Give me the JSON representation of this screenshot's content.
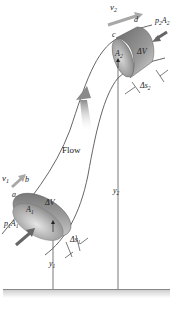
{
  "figure": {
    "flow_label": "Flow",
    "labels": {
      "v1": "v",
      "v1_sub": "1",
      "v2": "v",
      "v2_sub": "2",
      "a": "a",
      "b": "b",
      "c": "c",
      "d": "d",
      "A1": "A",
      "A1_sub": "1",
      "A2": "A",
      "A2_sub": "2",
      "dV1": "ΔV",
      "dV2": "ΔV",
      "p1A1": "p",
      "p1A1_sub1": "1",
      "p1A1_A": "A",
      "p1A1_sub2": "1",
      "p2A2": "p",
      "p2A2_sub1": "2",
      "p2A2_A": "A",
      "p2A2_sub2": "2",
      "ds1": "Δs",
      "ds1_sub": "1",
      "ds2": "Δs",
      "ds2_sub": "2",
      "y1": "y",
      "y1_sub": "1",
      "y2": "y",
      "y2_sub": "2"
    },
    "colors": {
      "tube_outline": "#555555",
      "cylinder_dark": "#6f6f6f",
      "cylinder_light": "#c9c9c9",
      "arrow_gray": "#8a8a8a",
      "force_arrow": "#666666",
      "ground": "#999999"
    }
  }
}
